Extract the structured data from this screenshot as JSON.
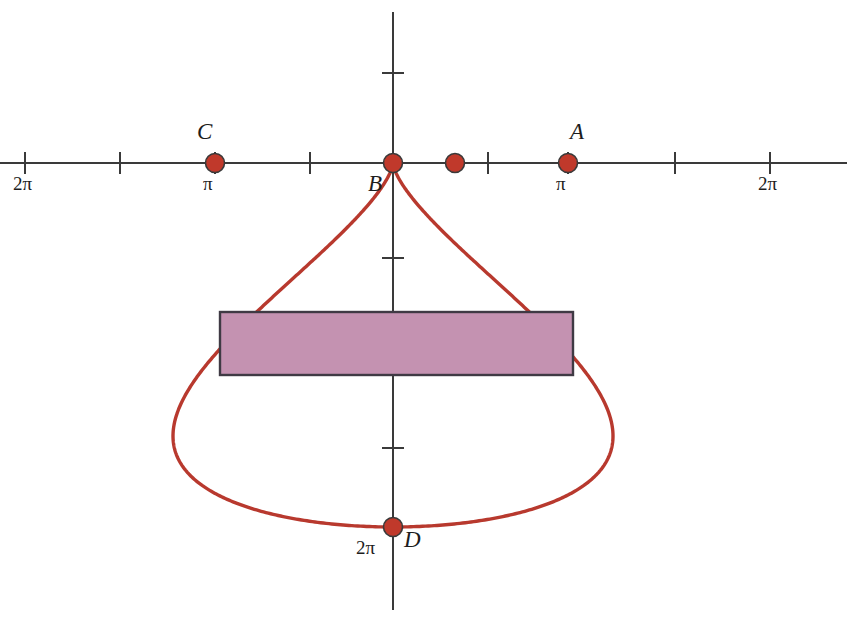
{
  "figure": {
    "background_color": "#ffffff",
    "width": 847,
    "height": 642
  },
  "colors": {
    "curve": "#b8392e",
    "marker_fill": "#c0392b",
    "marker_stroke": "#3a3a3a",
    "axis": "#3a3a3a",
    "rectangle_fill": "#c492b1",
    "rectangle_stroke": "#3f3a44",
    "text": "#1d1d1d"
  },
  "axes": {
    "x_axis": {
      "name": "horizontal-axis",
      "y_pixel": 163,
      "x_start": 0,
      "x_end": 847,
      "tick_half_length": 11,
      "tick_pixels": [
        25,
        120,
        215,
        310,
        393,
        488,
        568,
        675,
        770
      ],
      "tick_labels": [
        {
          "text": "2π",
          "x": 25,
          "y": 174
        },
        {
          "text": "π",
          "x": 215,
          "y": 174
        },
        {
          "text": "π",
          "x": 568,
          "y": 174
        },
        {
          "text": "2π",
          "x": 770,
          "y": 174
        }
      ]
    },
    "y_axis": {
      "name": "vertical-axis",
      "x_pixel": 393,
      "y_start": 12,
      "y_end": 610,
      "tick_half_length": 11,
      "tick_pixels": [
        73,
        163,
        258,
        353,
        448,
        527
      ],
      "tick_labels": [
        {
          "text": "2π",
          "x": 370,
          "y": 538
        }
      ]
    }
  },
  "curve": {
    "name": "cardioid-curve",
    "type": "cardioid",
    "equation": "r = a(1 - cosθ), reflected below the x-axis",
    "cusp_pixel": [
      393,
      163
    ],
    "stroke_width": 3.4,
    "lobe_peak_y_pixel": 116,
    "left_extent_x_pixel": 173,
    "right_extent_x_pixel": 613,
    "bottom_y_pixel": 527
  },
  "points": [
    {
      "label": "C",
      "name": "point-c",
      "x": 215,
      "y": 163,
      "r": 9.5,
      "label_dx": -22,
      "label_dy": -44,
      "tick_label": "π"
    },
    {
      "label": "B",
      "name": "point-b",
      "x": 393,
      "y": 163,
      "r": 9.5,
      "label_dx": -26,
      "label_dy": 8,
      "tick_label": ""
    },
    {
      "label": "",
      "name": "point-unlabeled",
      "x": 455,
      "y": 163,
      "r": 9.5,
      "label_dx": 0,
      "label_dy": 0,
      "tick_label": ""
    },
    {
      "label": "A",
      "name": "point-a",
      "x": 568,
      "y": 163,
      "r": 9.5,
      "label_dx": 5,
      "label_dy": -44,
      "tick_label": "π"
    },
    {
      "label": "D",
      "name": "point-d",
      "x": 393,
      "y": 527,
      "r": 9.5,
      "label_dx": 12,
      "label_dy": 8,
      "tick_label": "2π"
    }
  ],
  "point_labels": [
    {
      "text": "C",
      "x": 197,
      "y": 120
    },
    {
      "text": "B",
      "x": 368,
      "y": 172
    },
    {
      "text": "A",
      "x": 570,
      "y": 120
    },
    {
      "text": "D",
      "x": 404,
      "y": 528
    }
  ],
  "rectangle": {
    "name": "shaded-rectangle",
    "x": 220,
    "y": 312,
    "width": 353,
    "height": 63,
    "fill": "#c492b1",
    "stroke": "#3f3a44"
  },
  "chart_data": {
    "type": "line",
    "xlabel": "",
    "ylabel": "",
    "grid": false,
    "legend": "none",
    "x_tick_labels": [
      "2π",
      "",
      "π",
      "",
      "",
      "",
      "π",
      "",
      "2π"
    ],
    "y_tick_labels": [
      "",
      "",
      "",
      "",
      "",
      "2π"
    ],
    "annotations": [
      {
        "label": "C",
        "x": "-π",
        "y": "0"
      },
      {
        "label": "B",
        "x": "0",
        "y": "0"
      },
      {
        "label": "A",
        "x": "π",
        "y": "0"
      },
      {
        "label": "D",
        "x": "0",
        "y": "-2π"
      }
    ]
  }
}
